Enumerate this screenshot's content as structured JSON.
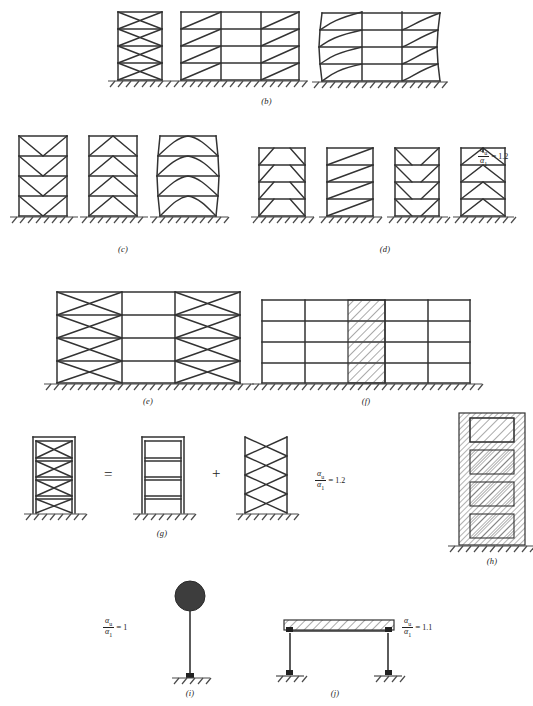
{
  "figure": {
    "title_caption": "",
    "panels": [
      {
        "id": "b",
        "label": "(b)",
        "description": "Frames with concentric X bracings: single bay, three-bay, and deformed three-bay",
        "ratio_text": null,
        "stories": 4,
        "variants": [
          "x-braced-single-bay",
          "x-braced-three-bay-diagonal",
          "x-braced-three-bay-deformed"
        ]
      },
      {
        "id": "c",
        "label": "(c)",
        "description": "Frames with concentric V bracings: V, inverted-V, and deformed",
        "ratio_text": null,
        "stories": 4,
        "variants": [
          "v-braced",
          "inverted-v-braced",
          "v-braced-deformed"
        ]
      },
      {
        "id": "d",
        "label": "(d)",
        "description": "Eccentrically braced frames: four configurations",
        "ratio_text": "1.2",
        "ratio_num": "α",
        "ratio_num_sub": "u",
        "ratio_den": "α",
        "ratio_den_sub": "1",
        "stories": 4,
        "variants": [
          "eccentric-diagonal",
          "eccentric-single-diagonal",
          "eccentric-v",
          "eccentric-inverted-v"
        ]
      },
      {
        "id": "e",
        "label": "(e)",
        "description": "Three-bay frame with X bracings in outer bays, moment frame in central bay",
        "ratio_text": null,
        "stories": 4,
        "variants": [
          "x-braced-outer-bays"
        ]
      },
      {
        "id": "f",
        "label": "(f)",
        "description": "Moment frame with central reinforced concrete shear wall",
        "ratio_text": null,
        "stories": 4,
        "variants": [
          "frame-with-central-shear-wall"
        ]
      },
      {
        "id": "g",
        "label": "(g)",
        "description": "Dual system decomposition: braced frame equals moment frame plus bracing system",
        "ratio_text": "1.2",
        "operators": [
          "=",
          "+"
        ],
        "stories": 4,
        "variants": [
          "dual-braced-frame",
          "moment-frame",
          "bracing-system"
        ]
      },
      {
        "id": "h",
        "label": "(h)",
        "description": "Coupled reinforced concrete shear wall with coupling beams",
        "ratio_text": null,
        "stories": 4,
        "variants": [
          "coupled-shear-wall"
        ]
      },
      {
        "id": "i",
        "label": "(i)",
        "description": "Inverted pendulum: single cantilever column with concentrated mass",
        "ratio_text": "1",
        "stories": 1,
        "variants": [
          "inverted-pendulum"
        ]
      },
      {
        "id": "j",
        "label": "(j)",
        "description": "Single storey portal frame with rigid slab",
        "ratio_text": "1.1",
        "stories": 1,
        "variants": [
          "portal-frame-with-slab"
        ]
      }
    ],
    "symbols": {
      "alpha": "α",
      "sub_u": "u",
      "sub_1": "1",
      "equals": "=",
      "plus": "+"
    },
    "colors": {
      "line": "#333333",
      "ground": "#4a4a4a",
      "hatch": "#555555",
      "mass": "#3d3d3d",
      "background": "#ffffff"
    }
  }
}
